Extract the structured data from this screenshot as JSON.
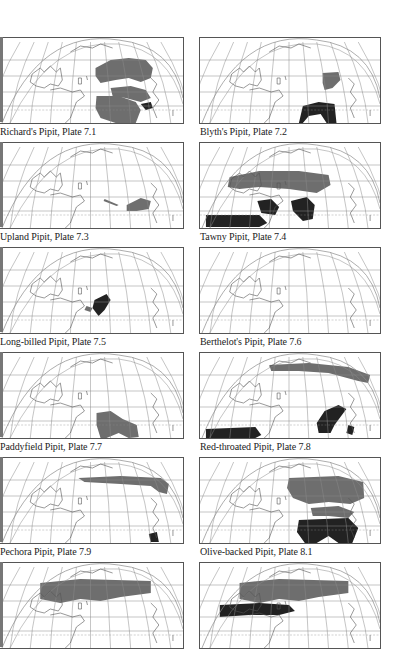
{
  "page": {
    "colors": {
      "background": "#ffffff",
      "frame": "#555555",
      "grid": "#8a8a8a",
      "coast": "#555555",
      "range_gray": "#6e6e6e",
      "range_black": "#222222"
    },
    "maps": [
      {
        "caption": "Richard's Pipit, Plate 7.1",
        "col": 0,
        "row": 0,
        "key": "richards"
      },
      {
        "caption": "Blyth's Pipit, Plate 7.2",
        "col": 1,
        "row": 0,
        "key": "blyths"
      },
      {
        "caption": "Upland Pipit, Plate 7.3",
        "col": 0,
        "row": 1,
        "key": "upland"
      },
      {
        "caption": "Tawny Pipit, Plate 7.4",
        "col": 1,
        "row": 1,
        "key": "tawny"
      },
      {
        "caption": "Long-billed Pipit, Plate 7.5",
        "col": 0,
        "row": 2,
        "key": "longbilled"
      },
      {
        "caption": "Berthelot's Pipit, Plate 7.6",
        "col": 1,
        "row": 2,
        "key": "berthelots"
      },
      {
        "caption": "Paddyfield Pipit, Plate 7.7",
        "col": 0,
        "row": 3,
        "key": "paddyfield"
      },
      {
        "caption": "Red-throated Pipit, Plate 7.8",
        "col": 1,
        "row": 3,
        "key": "redthroated"
      },
      {
        "caption": "Pechora Pipit, Plate 7.9",
        "col": 0,
        "row": 4,
        "key": "pechora"
      },
      {
        "caption": "Olive-backed Pipit, Plate 8.1",
        "col": 1,
        "row": 4,
        "key": "olivebacked"
      },
      {
        "caption": "",
        "col": 0,
        "row": 5,
        "key": "meadow"
      },
      {
        "caption": "",
        "col": 1,
        "row": 5,
        "key": "tree"
      }
    ]
  }
}
